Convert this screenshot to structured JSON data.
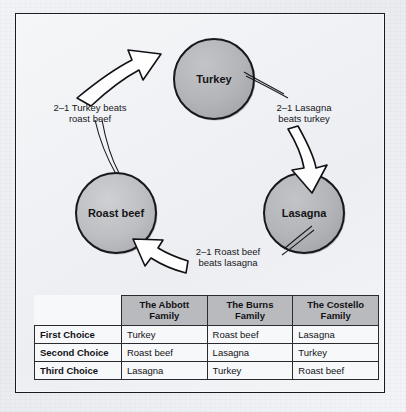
{
  "figure": {
    "nodes": [
      {
        "id": "turkey",
        "label": "Turkey",
        "cx": 198,
        "cy": 65,
        "r": 40
      },
      {
        "id": "roast-beef",
        "label": "Roast beef",
        "cx": 100,
        "cy": 199,
        "r": 40
      },
      {
        "id": "lasagna",
        "label": "Lasagna",
        "cx": 288,
        "cy": 199,
        "r": 40
      }
    ],
    "edges": [
      {
        "id": "roastbeef-to-turkey",
        "line1": "2–1 Turkey beats",
        "line2": "roast beef",
        "lx": 74,
        "ly": 96
      },
      {
        "id": "turkey-to-lasagna",
        "line1": "2–1 Lasagna",
        "line2": "beats turkey",
        "lx": 288,
        "ly": 96
      },
      {
        "id": "lasagna-to-roastbeef",
        "line1": "2–1 Roast beef",
        "line2": "beats lasagna",
        "lx": 212,
        "ly": 240
      }
    ],
    "colors": {
      "node_fill": "#b3b4b7",
      "node_stroke": "#1b1b20",
      "arrow_fill": "#ffffff",
      "arrow_stroke": "#121216",
      "frame": "#1b1b1f",
      "header_fill": "#b9babd",
      "paper": "#eceef1"
    }
  },
  "table": {
    "corner_label": "",
    "column_headers": [
      {
        "line1": "The Abbott",
        "line2": "Family"
      },
      {
        "line1": "The Burns",
        "line2": "Family"
      },
      {
        "line1": "The Costello",
        "line2": "Family"
      }
    ],
    "rows": [
      {
        "label": "First Choice",
        "cells": [
          "Turkey",
          "Roast beef",
          "Lasagna"
        ]
      },
      {
        "label": "Second Choice",
        "cells": [
          "Roast beef",
          "Lasagna",
          "Turkey"
        ]
      },
      {
        "label": "Third Choice",
        "cells": [
          "Lasagna",
          "Turkey",
          "Roast beef"
        ]
      }
    ]
  }
}
